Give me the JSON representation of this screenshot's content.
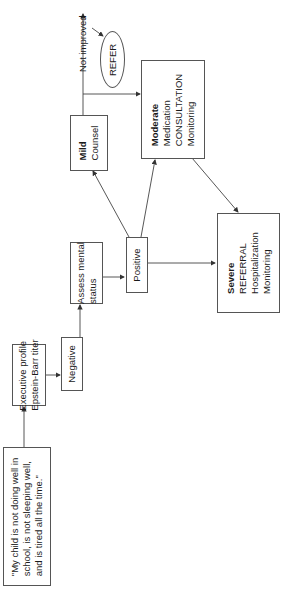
{
  "diagram": {
    "complaint": {
      "lines": [
        "\"My child is not doing well in",
        "school, is not sleeping well,",
        "and is tired all the time.\""
      ]
    },
    "executive": {
      "lines": [
        "Executive profile",
        "Epstein-Barr titer"
      ]
    },
    "negative": {
      "label": "Negative"
    },
    "assess": {
      "lines": [
        "Assess mental",
        "status"
      ]
    },
    "positive": {
      "label": "Positive"
    },
    "mild": {
      "title": "Mild",
      "lines": [
        "Counsel"
      ]
    },
    "moderate": {
      "title": "Moderate",
      "lines": [
        "Medication",
        "CONSULTATION",
        "Monitoring"
      ]
    },
    "severe": {
      "title": "Severe",
      "lines": [
        "REFERRAL",
        "Hospitalization",
        "Monitoring"
      ]
    },
    "refer": {
      "label": "REFER"
    },
    "not_improved": {
      "label": "Not improved"
    }
  }
}
